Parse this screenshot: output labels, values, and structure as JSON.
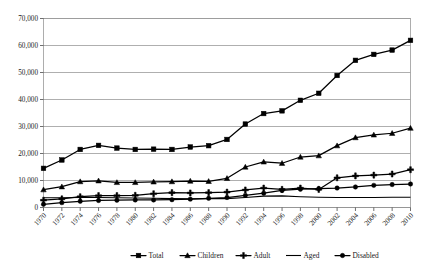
{
  "chart_data": {
    "type": "line",
    "title": "",
    "xlabel": "",
    "ylabel": "",
    "ylim": [
      0,
      70000
    ],
    "ytick_step": 10000,
    "ytick_labels": [
      "0",
      "10,000",
      "20,000",
      "30,000",
      "40,000",
      "50,000",
      "60,000",
      "70,000"
    ],
    "ytick_values": [
      0,
      10000,
      20000,
      30000,
      40000,
      50000,
      60000,
      70000
    ],
    "grid": true,
    "legend_position": "bottom",
    "categories": [
      "1970",
      "1972",
      "1974",
      "1976",
      "1978",
      "1980",
      "1982",
      "1984",
      "1986",
      "1988",
      "1990",
      "1992",
      "1994",
      "1996",
      "1998",
      "2000",
      "2002",
      "2004",
      "2006",
      "2008",
      "2010"
    ],
    "x": [
      1970,
      1972,
      1974,
      1976,
      1978,
      1980,
      1982,
      1984,
      1986,
      1988,
      1990,
      1992,
      1994,
      1996,
      1998,
      2000,
      2002,
      2004,
      2006,
      2008,
      2010
    ],
    "series": [
      {
        "name": "Total",
        "marker": "square",
        "values": [
          14500,
          17600,
          21500,
          23000,
          22000,
          21500,
          21600,
          21500,
          22400,
          22900,
          25200,
          30900,
          34800,
          35800,
          39700,
          42300,
          48900,
          54500,
          56700,
          58300,
          61900
        ]
      },
      {
        "name": "Children",
        "marker": "triangle",
        "values": [
          6600,
          7700,
          9600,
          9900,
          9300,
          9300,
          9500,
          9600,
          9800,
          9700,
          10800,
          15000,
          16900,
          16400,
          18700,
          19200,
          22900,
          25900,
          26900,
          27500,
          29400
        ]
      },
      {
        "name": "Adult",
        "marker": "cross",
        "values": [
          2700,
          3200,
          4000,
          4400,
          4400,
          4500,
          5100,
          5500,
          5400,
          5500,
          5700,
          6500,
          7200,
          6700,
          7200,
          6700,
          11000,
          11700,
          12000,
          12400,
          14000
        ]
      },
      {
        "name": "Aged",
        "marker": "none",
        "values": [
          3600,
          3600,
          3700,
          3700,
          3600,
          3500,
          3400,
          3300,
          3200,
          3300,
          3300,
          3700,
          4200,
          4300,
          4000,
          3800,
          3700,
          3700,
          3700,
          3800,
          3800
        ]
      },
      {
        "name": "Disabled",
        "marker": "circle",
        "values": [
          1200,
          1800,
          2300,
          2600,
          2700,
          2800,
          2800,
          2900,
          3100,
          3400,
          3700,
          4500,
          5300,
          6300,
          6800,
          7000,
          7200,
          7600,
          8200,
          8500,
          8700
        ]
      }
    ],
    "legend": [
      "Total",
      "Children",
      "Adult",
      "Aged",
      "Disabled"
    ],
    "colors": {
      "series": "#000000",
      "grid": "#8c8c8c",
      "background": "#ffffff"
    }
  }
}
